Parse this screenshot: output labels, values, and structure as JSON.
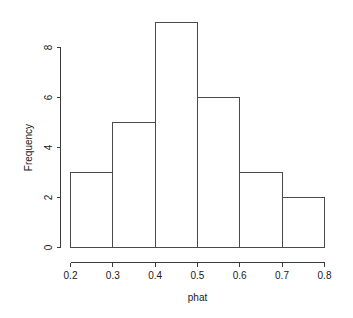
{
  "chart_data": {
    "type": "bar",
    "title": "",
    "subtitle": "",
    "xlabel": "phat",
    "ylabel": "Frequency",
    "categories": [
      "0.2-0.3",
      "0.3-0.4",
      "0.4-0.5",
      "0.5-0.6",
      "0.6-0.7",
      "0.7-0.8"
    ],
    "bin_edges": [
      0.2,
      0.3,
      0.4,
      0.5,
      0.6,
      0.7,
      0.8
    ],
    "values": [
      3,
      5,
      9,
      6,
      3,
      2
    ],
    "bins": [
      {
        "left": 0.2,
        "right": 0.3,
        "count": 3
      },
      {
        "left": 0.3,
        "right": 0.4,
        "count": 5
      },
      {
        "left": 0.4,
        "right": 0.5,
        "count": 9
      },
      {
        "left": 0.5,
        "right": 0.6,
        "count": 6
      },
      {
        "left": 0.6,
        "right": 0.7,
        "count": 3
      },
      {
        "left": 0.7,
        "right": 0.8,
        "count": 2
      }
    ],
    "xlim": [
      0.2,
      0.8
    ],
    "ylim": [
      0,
      9
    ],
    "x_ticks": [
      0.2,
      0.3,
      0.4,
      0.5,
      0.6,
      0.7,
      0.8
    ],
    "x_tick_labels": [
      "0.2",
      "0.3",
      "0.4",
      "0.5",
      "0.6",
      "0.7",
      "0.8"
    ],
    "y_ticks": [
      0,
      2,
      4,
      6,
      8
    ],
    "y_tick_labels": [
      "0",
      "2",
      "4",
      "6",
      "8"
    ],
    "grid": false,
    "legend": false,
    "bar_fill_color": "#ffffff",
    "bar_border_color": "#4a4a4a",
    "axis_color": "#3a3a3a",
    "background_color": "#ffffff",
    "total_count": 28
  },
  "axes": {
    "x_title": "phat",
    "y_title": "Frequency",
    "x_tick_labels": [
      "0.2",
      "0.3",
      "0.4",
      "0.5",
      "0.6",
      "0.7",
      "0.8"
    ],
    "y_tick_labels": [
      "0",
      "2",
      "4",
      "6",
      "8"
    ]
  }
}
